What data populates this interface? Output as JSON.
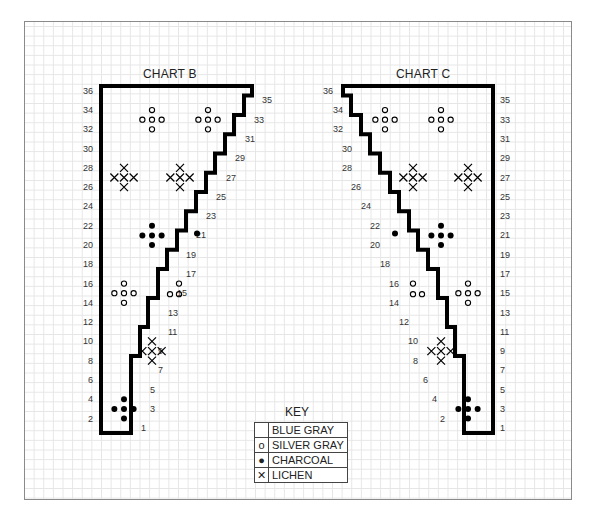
{
  "charts": [
    {
      "title": "CHART B",
      "left_row_labels": [
        "36",
        "34",
        "32",
        "30",
        "28",
        "26",
        "24",
        "22",
        "20",
        "18",
        "16",
        "14",
        "12",
        "10",
        "8",
        "6",
        "4",
        "2"
      ],
      "right_row_labels": [
        "35",
        "33",
        "31",
        "29",
        "27",
        "25",
        "23",
        "21",
        "19",
        "17",
        "15",
        "13",
        "11",
        "9",
        "7",
        "5",
        "3",
        "1"
      ]
    },
    {
      "title": "CHART C",
      "left_row_labels": [
        "36",
        "34",
        "32",
        "30",
        "28",
        "26",
        "24",
        "22",
        "20",
        "18",
        "16",
        "14",
        "12",
        "10",
        "8",
        "6",
        "4",
        "2"
      ],
      "right_row_labels": [
        "35",
        "33",
        "31",
        "29",
        "27",
        "25",
        "23",
        "21",
        "19",
        "17",
        "15",
        "13",
        "11",
        "9",
        "7",
        "5",
        "3",
        "1"
      ]
    }
  ],
  "key": {
    "title": "KEY",
    "items": [
      {
        "symbol": "",
        "label": "BLUE GRAY",
        "symbol_name": "blank"
      },
      {
        "symbol": "o",
        "label": "SILVER GRAY",
        "symbol_name": "open-circle"
      },
      {
        "symbol": "●",
        "label": "CHARCOAL",
        "symbol_name": "filled-dot"
      },
      {
        "symbol": "✕",
        "label": "LICHEN",
        "symbol_name": "cross"
      }
    ]
  },
  "colors": {
    "grid": "#e6e6e6",
    "outline": "#000000",
    "text": "#222222",
    "frame": "#8a8a8a"
  }
}
